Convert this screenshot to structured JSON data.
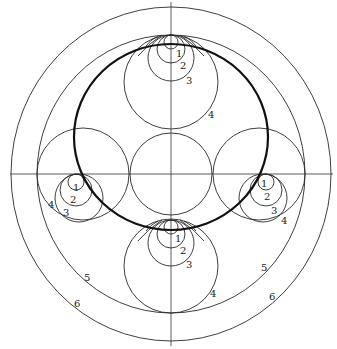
{
  "figure": {
    "colors": {
      "line": "#2a2a2a",
      "heavy_line": "#111111",
      "background": "#ffffff"
    },
    "labels": {
      "top": [
        "1",
        "2",
        "3",
        "4"
      ],
      "left": [
        "1",
        "2",
        "3",
        "4"
      ],
      "right": [
        "1",
        "2",
        "3",
        "4"
      ],
      "bottom": [
        "1",
        "2",
        "3",
        "4"
      ],
      "outer_left": [
        "5",
        "6"
      ],
      "outer_right": [
        "5",
        "6"
      ]
    }
  }
}
